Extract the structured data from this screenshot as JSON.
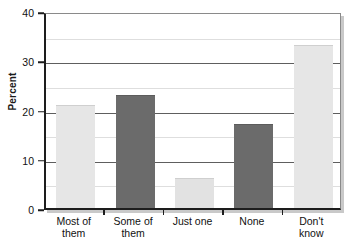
{
  "chart_data": {
    "type": "bar",
    "title": "",
    "xlabel": "",
    "ylabel": "Percent",
    "categories": [
      "Most of them",
      "Some of them",
      "Just one",
      "None",
      "Don't know"
    ],
    "category_lines": [
      [
        "Most of",
        "them"
      ],
      [
        "Some of",
        "them"
      ],
      [
        "Just one",
        ""
      ],
      [
        "None",
        ""
      ],
      [
        "Don't",
        "know"
      ]
    ],
    "values": [
      21,
      23,
      6,
      17,
      33
    ],
    "ylim": [
      0,
      40
    ],
    "y_ticks": [
      0,
      10,
      20,
      30,
      40
    ],
    "y_tick_labels": [
      "0",
      "10",
      "20",
      "30",
      "40"
    ],
    "minor_gridlines": [
      5,
      15,
      25,
      35
    ],
    "grid": true,
    "legend": "none",
    "bar_colors": [
      "#e6e6e6",
      "#6b6b6b",
      "#e2e2e2",
      "#6b6b6b",
      "#e6e6e6"
    ],
    "bar_border_colors": [
      "#cfcfcf",
      "#5c5c5c",
      "#cfcfcf",
      "#5c5c5c",
      "#cfcfcf"
    ]
  },
  "axes": {
    "y_title": "Percent"
  }
}
